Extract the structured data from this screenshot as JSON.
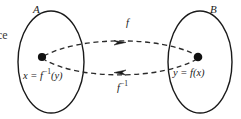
{
  "figure": {
    "title_fragment": "ce",
    "sets": [
      {
        "name": "set-a",
        "label": "A",
        "cx": 51,
        "cy": 62,
        "rx": 33,
        "ry": 51
      },
      {
        "name": "set-b",
        "label": "B",
        "cx": 200,
        "cy": 62,
        "rx": 32,
        "ry": 51
      }
    ],
    "points": [
      {
        "name": "point-x",
        "label": "x = f",
        "exponent": "−1",
        "argument": "(y)",
        "cx": 42,
        "cy": 57
      },
      {
        "name": "point-y",
        "label": "y = f(x)",
        "cx": 198,
        "cy": 57
      }
    ],
    "arrows": [
      {
        "name": "forward-map",
        "label": "f",
        "exponent": "",
        "direction": "right",
        "from": "A",
        "to": "B",
        "label_x": 126,
        "label_y": 23
      },
      {
        "name": "inverse-map",
        "label": "f",
        "exponent": "−1",
        "direction": "left",
        "from": "B",
        "to": "A",
        "label_x": 119,
        "label_y": 85
      }
    ],
    "colors": {
      "stroke": "#1a1a1a",
      "dash_stroke": "#2b2b2b",
      "background": "#ffffff",
      "point_fill": "#111111"
    },
    "stroke_width": 1.3,
    "dash_pattern": "5,3.5"
  }
}
